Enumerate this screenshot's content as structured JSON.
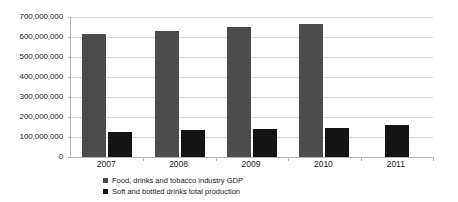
{
  "chart_data": {
    "type": "bar",
    "title": "",
    "subtitle": "",
    "xlabel": "",
    "ylabel": "",
    "categories": [
      "2007",
      "2008",
      "2009",
      "2010",
      "2011"
    ],
    "series": [
      {
        "name": "Food, drinks and tobacco industry GDP",
        "color": "#4c4c4c",
        "values": [
          615000000,
          632000000,
          648000000,
          665000000,
          null
        ]
      },
      {
        "name": "Soft and bottled drinks total production",
        "color": "#141414",
        "values": [
          126000000,
          135000000,
          142000000,
          145000000,
          158000000
        ]
      }
    ],
    "ylim": [
      0,
      700000000
    ],
    "ytick_values": [
      0,
      100000000,
      200000000,
      300000000,
      400000000,
      500000000,
      600000000,
      700000000
    ],
    "ytick_labels": [
      "0",
      "100,000,000",
      "200,000,000",
      "300,000,000",
      "400,000,000",
      "500,000,000",
      "600,000,000",
      "700,000,000"
    ],
    "grid": true,
    "legend_position": "bottom"
  }
}
